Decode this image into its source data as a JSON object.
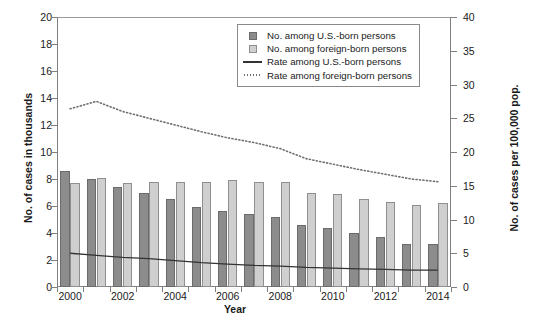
{
  "axes": {
    "left": {
      "title": "No. of cases in thousands",
      "ticks": [
        "0",
        "2",
        "4",
        "6",
        "8",
        "10",
        "12",
        "14",
        "16",
        "18",
        "20"
      ],
      "min": 0,
      "max": 20,
      "step": 2
    },
    "right": {
      "title": "No. of cases per 100,000 pop.",
      "ticks": [
        "0",
        "5",
        "10",
        "15",
        "20",
        "25",
        "30",
        "35",
        "40"
      ],
      "min": 0,
      "max": 40,
      "step": 5
    },
    "x": {
      "title": "Year",
      "ticks": [
        "2000",
        "2002",
        "2004",
        "2006",
        "2008",
        "2010",
        "2012",
        "2014"
      ]
    }
  },
  "legend": {
    "items": [
      {
        "label": "No. among U.S.-born persons",
        "key": "swatch-dark",
        "color": "#8c8c8c"
      },
      {
        "label": "No. among foreign-born persons",
        "key": "swatch-light",
        "color": "#cfcfcf"
      },
      {
        "label": "Rate among U.S.-born persons",
        "key": "line-solid",
        "color": "#333333"
      },
      {
        "label": "Rate among foreign-born persons",
        "key": "line-dotted",
        "color": "#6f6f6f"
      }
    ]
  },
  "chart_data": {
    "type": "bar",
    "title": "",
    "xlabel": "Year",
    "ylabel": "No. of cases in thousands",
    "y2label": "No. of cases per 100,000 pop.",
    "ylim": [
      0,
      20
    ],
    "y2lim": [
      0,
      40
    ],
    "grid": false,
    "legend_position": "top-right",
    "categories": [
      "2000",
      "2001",
      "2002",
      "2003",
      "2004",
      "2005",
      "2006",
      "2007",
      "2008",
      "2009",
      "2010",
      "2011",
      "2012",
      "2013",
      "2014"
    ],
    "series": [
      {
        "name": "No. among U.S.-born persons",
        "type": "bar",
        "axis": "left",
        "unit": "thousands of cases",
        "color": "#8c8c8c",
        "values": [
          8.6,
          8.0,
          7.4,
          7.0,
          6.5,
          5.9,
          5.6,
          5.4,
          5.2,
          4.6,
          4.4,
          4.0,
          3.7,
          3.2,
          3.2
        ]
      },
      {
        "name": "No. among foreign-born persons",
        "type": "bar",
        "axis": "left",
        "unit": "thousands of cases",
        "color": "#cfcfcf",
        "values": [
          7.7,
          8.1,
          7.7,
          7.8,
          7.8,
          7.8,
          7.9,
          7.8,
          7.8,
          7.0,
          6.9,
          6.5,
          6.3,
          6.1,
          6.2
        ]
      },
      {
        "name": "Rate among U.S.-born persons",
        "type": "line",
        "style": "solid",
        "axis": "right",
        "unit": "cases per 100,000 pop.",
        "color": "#333333",
        "values": [
          5.0,
          4.7,
          4.4,
          4.2,
          3.9,
          3.6,
          3.4,
          3.2,
          3.1,
          2.9,
          2.8,
          2.7,
          2.6,
          2.5,
          2.5
        ]
      },
      {
        "name": "Rate among foreign-born persons",
        "type": "line",
        "style": "dotted",
        "axis": "right",
        "unit": "cases per 100,000 pop.",
        "color": "#6f6f6f",
        "values": [
          26.4,
          27.5,
          26.0,
          25.0,
          24.0,
          23.0,
          22.1,
          21.4,
          20.5,
          19.0,
          18.2,
          17.4,
          16.7,
          16.0,
          15.6
        ]
      }
    ]
  }
}
